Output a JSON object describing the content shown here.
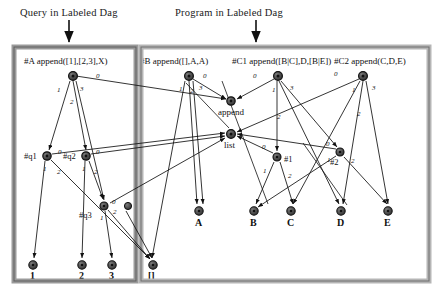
{
  "figure": {
    "titles": {
      "query": "Query in Labeled Dag",
      "program": "Program in Labeled Dag"
    },
    "panels": [
      {
        "id": "query-panel",
        "title_ref": "query"
      },
      {
        "id": "program-panel",
        "title_ref": "program"
      }
    ],
    "clause_headers": [
      {
        "name": "#A",
        "term": "append([1],[2,3],X)"
      },
      {
        "name": "#B",
        "term": "append([],A,A)"
      },
      {
        "name": "#C1",
        "term": "append([B|C],D,[B|E])"
      },
      {
        "name": "#C2",
        "term": "append(C,D,E)"
      }
    ],
    "internal_nodes": [
      {
        "id": "A",
        "label": "#A",
        "cx": 73,
        "cy": 76,
        "label_side": "left"
      },
      {
        "id": "q1",
        "label": "#q1",
        "cx": 47,
        "cy": 156,
        "label_side": "left"
      },
      {
        "id": "q2",
        "label": "#q2",
        "cx": 86,
        "cy": 156,
        "label_side": "left"
      },
      {
        "id": "q3",
        "label": "#q3",
        "cx": 104,
        "cy": 206,
        "label_side": "below-left"
      },
      {
        "id": "X",
        "label": "",
        "cx": 128,
        "cy": 206,
        "label_side": "none"
      },
      {
        "id": "B",
        "label": "#B",
        "cx": 189,
        "cy": 76,
        "label_side": "header"
      },
      {
        "id": "C1",
        "label": "#C1",
        "cx": 278,
        "cy": 76,
        "label_side": "header"
      },
      {
        "id": "C2",
        "label": "#C2",
        "cx": 363,
        "cy": 76,
        "label_side": "header"
      },
      {
        "id": "append",
        "label": "append",
        "cx": 231,
        "cy": 101,
        "label_side": "below"
      },
      {
        "id": "list",
        "label": "list",
        "cx": 231,
        "cy": 134,
        "label_side": "below"
      },
      {
        "id": "n1",
        "label": "#1",
        "cx": 277,
        "cy": 157,
        "label_side": "right"
      },
      {
        "id": "n2",
        "label": "#2",
        "cx": 340,
        "cy": 152,
        "label_side": "below-right"
      }
    ],
    "leaf_nodes": [
      {
        "id": "l1",
        "label": "1",
        "cx": 33,
        "cy": 265
      },
      {
        "id": "l2",
        "label": "2",
        "cx": 82,
        "cy": 265
      },
      {
        "id": "l3",
        "label": "3",
        "cx": 112,
        "cy": 265
      },
      {
        "id": "lnil",
        "label": "[]",
        "cx": 153,
        "cy": 265
      },
      {
        "id": "lA",
        "label": "A",
        "cx": 199,
        "cy": 211
      },
      {
        "id": "lB",
        "label": "B",
        "cx": 254,
        "cy": 211
      },
      {
        "id": "lC",
        "label": "C",
        "cx": 291,
        "cy": 211
      },
      {
        "id": "lD",
        "label": "D",
        "cx": 341,
        "cy": 211
      },
      {
        "id": "lE",
        "label": "E",
        "cx": 388,
        "cy": 211
      }
    ],
    "edges": [
      {
        "from": "A",
        "to": "append",
        "label": "0"
      },
      {
        "from": "A",
        "to": "q1",
        "label": "1"
      },
      {
        "from": "A",
        "to": "q2",
        "label": "2"
      },
      {
        "from": "A",
        "to": "q3",
        "label": "3"
      },
      {
        "from": "q1",
        "to": "l1",
        "label": "1"
      },
      {
        "from": "q1",
        "to": "lnil",
        "label": "2"
      },
      {
        "from": "q1",
        "to": "list",
        "label": "0"
      },
      {
        "from": "q2",
        "to": "l2",
        "label": "1"
      },
      {
        "from": "q2",
        "to": "q3",
        "label": "2"
      },
      {
        "from": "q2",
        "to": "list",
        "label": "0"
      },
      {
        "from": "q3",
        "to": "l3",
        "label": "1"
      },
      {
        "from": "q3",
        "to": "lnil",
        "label": "2"
      },
      {
        "from": "q3",
        "to": "list",
        "label": "0"
      },
      {
        "from": "B",
        "to": "append",
        "label": "0"
      },
      {
        "from": "B",
        "to": "lnil",
        "label": "1"
      },
      {
        "from": "B",
        "to": "lA",
        "label": "2"
      },
      {
        "from": "B",
        "to": "lA",
        "label": "3"
      },
      {
        "from": "C1",
        "to": "append",
        "label": "0"
      },
      {
        "from": "C1",
        "to": "n1",
        "label": "1"
      },
      {
        "from": "C1",
        "to": "lD",
        "label": "2"
      },
      {
        "from": "C1",
        "to": "n2",
        "label": "3"
      },
      {
        "from": "C2",
        "to": "append",
        "label": "0"
      },
      {
        "from": "C2",
        "to": "lC",
        "label": "1"
      },
      {
        "from": "C2",
        "to": "lD",
        "label": "2"
      },
      {
        "from": "C2",
        "to": "lE",
        "label": "3"
      },
      {
        "from": "n1",
        "to": "list",
        "label": "0"
      },
      {
        "from": "n1",
        "to": "lB",
        "label": "1"
      },
      {
        "from": "n1",
        "to": "lC",
        "label": "2"
      },
      {
        "from": "n2",
        "to": "list",
        "label": "0"
      },
      {
        "from": "n2",
        "to": "lB",
        "label": "1"
      },
      {
        "from": "n2",
        "to": "lE",
        "label": "2"
      }
    ],
    "colors": {
      "stroke": "#111111",
      "node_fill": "#4a4a4a",
      "panel_border": "#9a9a9a",
      "background": "#ffffff"
    }
  }
}
